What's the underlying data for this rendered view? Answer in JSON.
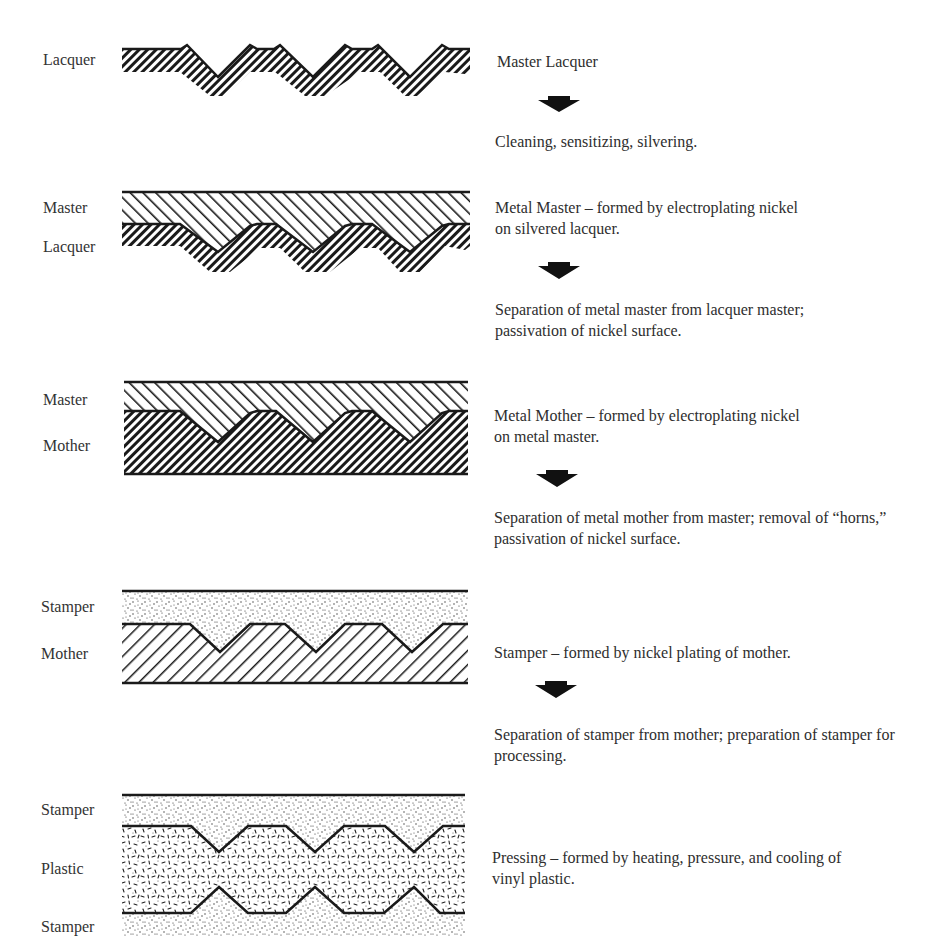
{
  "diagram": {
    "type": "process-flow cross-section",
    "stages": [
      {
        "id": "lacquer",
        "layer_labels": [
          "Lacquer"
        ],
        "description": "Master Lacquer",
        "next_step": "Cleaning, sensitizing, silvering."
      },
      {
        "id": "metal-master",
        "layer_labels": [
          "Master",
          "Lacquer"
        ],
        "description": "Metal Master – formed by electroplating nickel on silvered lacquer.",
        "next_step": "Separation of metal master from lacquer master; passivation of nickel surface."
      },
      {
        "id": "metal-mother",
        "layer_labels": [
          "Master",
          "Mother"
        ],
        "description": "Metal Mother – formed by electroplating nickel on metal master.",
        "next_step": "Separation of metal mother from master; removal of “horns,” passivation of nickel surface."
      },
      {
        "id": "stamper",
        "layer_labels": [
          "Stamper",
          "Mother"
        ],
        "description": "Stamper – formed by nickel plating of mother.",
        "next_step": "Separation of stamper from mother; preparation of stamper for processing."
      },
      {
        "id": "pressing",
        "layer_labels": [
          "Stamper",
          "Plastic",
          "Stamper"
        ],
        "description": "Pressing – formed by heating, pressure, and cooling of vinyl plastic.",
        "next_step": null
      }
    ],
    "arrow_icon": "down-arrow-icon",
    "colors": {
      "ink": "#1a1a1a",
      "text": "#2e2e2e",
      "background": "#ffffff"
    }
  }
}
